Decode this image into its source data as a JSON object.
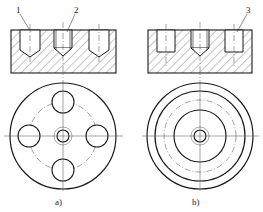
{
  "figure": {
    "views": [
      {
        "id": "a",
        "caption": "a)",
        "callouts": [
          {
            "num": "1"
          },
          {
            "num": "2"
          }
        ]
      },
      {
        "id": "b",
        "caption": "b)",
        "callouts": [
          {
            "num": "3"
          }
        ]
      }
    ]
  },
  "colors": {
    "line": "#1a1a1a",
    "hatch": "#555555",
    "center": "#444444"
  }
}
